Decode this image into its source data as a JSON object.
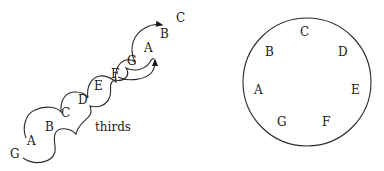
{
  "spiral": {
    "caption": "thirds",
    "notes": [
      {
        "label": "G",
        "x": 16,
        "y": 158
      },
      {
        "label": "A",
        "x": 32,
        "y": 145
      },
      {
        "label": "B",
        "x": 50,
        "y": 131
      },
      {
        "label": "C",
        "x": 66,
        "y": 117
      },
      {
        "label": "D",
        "x": 83,
        "y": 104
      },
      {
        "label": "E",
        "x": 99,
        "y": 90
      },
      {
        "label": "F",
        "x": 116,
        "y": 78
      },
      {
        "label": "G",
        "x": 132,
        "y": 65
      },
      {
        "label": "A",
        "x": 149,
        "y": 52
      },
      {
        "label": "B",
        "x": 162,
        "y": 38
      },
      {
        "label": "C",
        "x": 178,
        "y": 22
      }
    ]
  },
  "circle": {
    "notes": [
      {
        "label": "C",
        "x": 305,
        "y": 36
      },
      {
        "label": "B",
        "x": 270,
        "y": 56
      },
      {
        "label": "D",
        "x": 343,
        "y": 56
      },
      {
        "label": "A",
        "x": 259,
        "y": 94
      },
      {
        "label": "E",
        "x": 355,
        "y": 94
      },
      {
        "label": "G",
        "x": 282,
        "y": 126
      },
      {
        "label": "F",
        "x": 326,
        "y": 126
      }
    ]
  },
  "colors": {
    "ink": "#1a1a1a",
    "background": "#ffffff"
  }
}
